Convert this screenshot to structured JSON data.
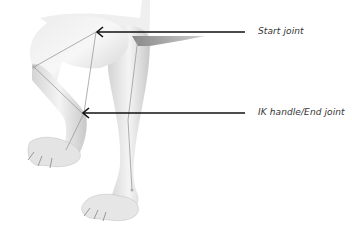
{
  "figure": {
    "callouts": [
      {
        "id": "start",
        "label": "Start joint"
      },
      {
        "id": "end",
        "label": "IK handle/End joint"
      }
    ],
    "colors": {
      "background": "#ffffff",
      "arrow": "#111111",
      "mesh_light": "#f2f2f2",
      "mesh_mid": "#d9d9d9",
      "mesh_dark": "#b8b8b8",
      "bone_line": "#9a9a9a",
      "label_text": "#333333"
    }
  }
}
